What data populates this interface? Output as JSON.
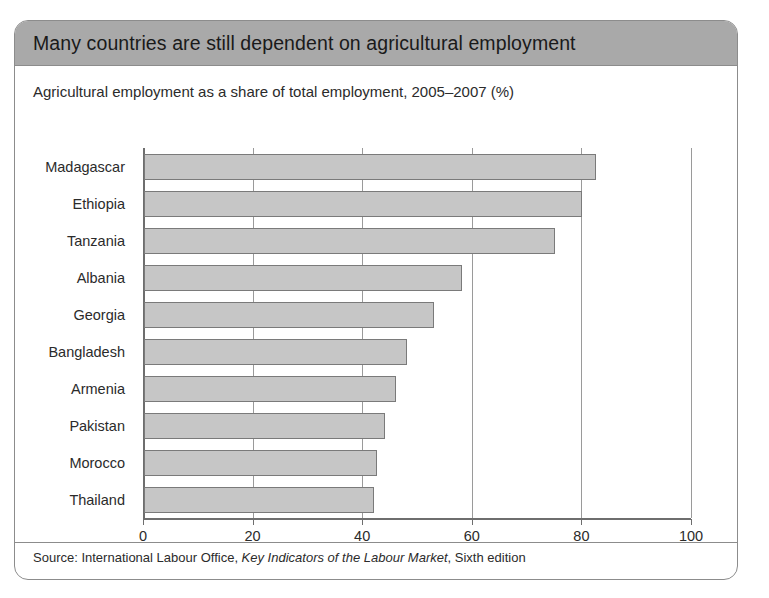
{
  "card": {
    "title": "Many countries are still dependent on agricultural employment",
    "subtitle": "Agricultural employment as a share of total employment, 2005–2007 (%)",
    "source_prefix": "Source: International Labour Office, ",
    "source_italic": "Key Indicators of the Labour Market",
    "source_suffix": ", Sixth edition",
    "header_color": "#a9a9a9",
    "border_color": "#8c8c8c",
    "bar_color": "#c6c6c6",
    "bar_border_color": "#7a7a7a"
  },
  "chart_data": {
    "type": "bar",
    "orientation": "horizontal",
    "title": "Many countries are still dependent on agricultural employment",
    "subtitle": "Agricultural employment as a share of total employment, 2005–2007 (%)",
    "xlabel": "",
    "ylabel": "",
    "xlim": [
      0,
      100
    ],
    "xticks": [
      0,
      20,
      40,
      60,
      80,
      100
    ],
    "xticklabels": [
      "0",
      "20",
      "40",
      "60",
      "80",
      "100"
    ],
    "grid": "vertical",
    "legend": "none",
    "categories": [
      "Madagascar",
      "Ethiopia",
      "Tanzania",
      "Albania",
      "Georgia",
      "Bangladesh",
      "Armenia",
      "Pakistan",
      "Morocco",
      "Thailand"
    ],
    "values": [
      82.5,
      80,
      75,
      58,
      53,
      48,
      46,
      44,
      42.5,
      42
    ],
    "units": "%"
  }
}
